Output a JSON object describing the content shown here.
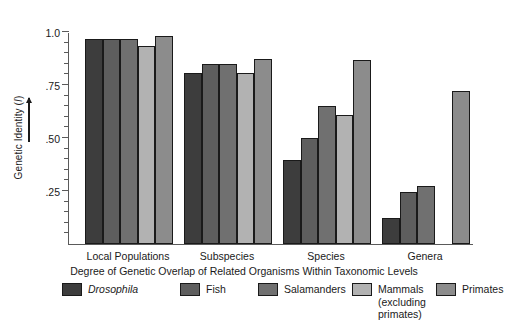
{
  "chart_data": {
    "type": "bar",
    "title": "",
    "xlabel": "Degree of Genetic Overlap of Related Organisms Within Taxonomic Levels",
    "ylabel": "Genetic Identity (I)",
    "ylim": [
      0,
      1.0
    ],
    "ytick_labels": [
      "1.0",
      ".75",
      ".50",
      ".25"
    ],
    "ytick_values": [
      1.0,
      0.75,
      0.5,
      0.25
    ],
    "minor_ticks": true,
    "grid": false,
    "legend_position": "bottom",
    "categories": [
      "Local Populations",
      "Subspecies",
      "Species",
      "Genera"
    ],
    "series": [
      {
        "name": "Drosophila",
        "color": "#3d3d3d",
        "italic": true,
        "values": [
          0.965,
          0.805,
          0.395,
          0.125
        ]
      },
      {
        "name": "Fish",
        "color": "#5e5e5e",
        "italic": false,
        "values": [
          0.965,
          0.85,
          0.5,
          0.245
        ]
      },
      {
        "name": "Salamanders",
        "color": "#707070",
        "italic": false,
        "values": [
          0.965,
          0.85,
          0.65,
          0.275
        ]
      },
      {
        "name": "Mammals\n(excluding\nprimates)",
        "color": "#b2b2b2",
        "italic": false,
        "values": [
          0.935,
          0.805,
          0.61,
          0.0
        ]
      },
      {
        "name": "Primates",
        "color": "#8c8c8c",
        "italic": false,
        "values": [
          0.98,
          0.875,
          0.87,
          0.72
        ]
      }
    ]
  },
  "axis": {
    "ylabel": "Genetic Identity (I)",
    "ylabel_symbol": "I",
    "ylabel_prefix": "Genetic Identity (",
    "ylabel_suffix": ")",
    "xcaption": "Degree of Genetic Overlap of Related Organisms Within Taxonomic Levels"
  },
  "colors": {
    "axis": "#5a5a5a",
    "bar_outline": "#1a1a1a",
    "background": "#ffffff",
    "text": "#1a1a1a"
  }
}
